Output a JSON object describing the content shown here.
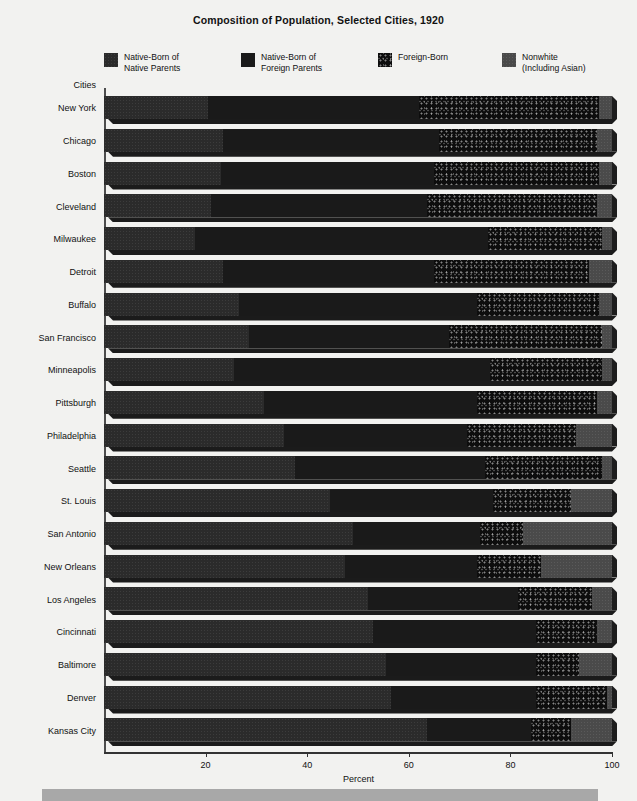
{
  "title": "Composition of Population, Selected Cities, 1920",
  "axis": {
    "y_title": "Cities",
    "x_title": "Percent",
    "x_ticks": [
      "20",
      "40",
      "60",
      "80",
      "100"
    ]
  },
  "legend": [
    {
      "key": "native_native",
      "label": "Native-Born of\nNative Parents",
      "color": "#2b2b2b"
    },
    {
      "key": "native_foreign",
      "label": "Native-Born of\nForeign Parents",
      "color": "#1a1a1a"
    },
    {
      "key": "foreign_born",
      "label": "Foreign-Born",
      "color": "#0d0d0d"
    },
    {
      "key": "nonwhite",
      "label": "Nonwhite\n(Including Asian)",
      "color": "#4a4a4a"
    }
  ],
  "chart_data": {
    "type": "bar",
    "orientation": "horizontal",
    "stacked": true,
    "title": "Composition of Population, Selected Cities, 1920",
    "xlabel": "Percent",
    "ylabel": "Cities",
    "xlim": [
      0,
      100
    ],
    "xticks": [
      20,
      40,
      60,
      80,
      100
    ],
    "grid": false,
    "legend_position": "top",
    "categories": [
      "New York",
      "Chicago",
      "Boston",
      "Cleveland",
      "Milwaukee",
      "Detroit",
      "Buffalo",
      "San Francisco",
      "Minneapolis",
      "Pittsburgh",
      "Philadelphia",
      "Seattle",
      "St. Louis",
      "San Antonio",
      "New Orleans",
      "Los Angeles",
      "Cincinnati",
      "Baltimore",
      "Denver",
      "Kansas City"
    ],
    "series": [
      {
        "name": "Native-Born of Native Parents",
        "values": [
          20.5,
          23.5,
          23.0,
          21.0,
          18.0,
          23.5,
          26.5,
          28.5,
          25.5,
          31.5,
          35.5,
          37.5,
          44.5,
          49.0,
          47.5,
          52.0,
          53.0,
          55.5,
          56.5,
          63.5
        ]
      },
      {
        "name": "Native-Born of Foreign Parents",
        "values": [
          41.5,
          42.5,
          42.0,
          42.5,
          57.5,
          41.5,
          47.0,
          39.5,
          50.5,
          42.0,
          36.0,
          37.5,
          32.0,
          25.0,
          26.0,
          29.5,
          32.0,
          29.5,
          28.5,
          20.5
        ]
      },
      {
        "name": "Foreign-Born",
        "values": [
          35.5,
          31.0,
          32.5,
          33.5,
          22.5,
          30.5,
          24.0,
          30.0,
          22.0,
          23.5,
          21.5,
          23.0,
          15.5,
          8.5,
          12.5,
          14.5,
          12.0,
          8.5,
          14.0,
          8.0
        ]
      },
      {
        "name": "Nonwhite (Including Asian)",
        "values": [
          2.5,
          3.0,
          2.5,
          3.0,
          2.0,
          4.5,
          2.5,
          2.0,
          2.0,
          3.0,
          7.0,
          2.0,
          8.0,
          17.5,
          14.0,
          4.0,
          3.0,
          6.5,
          1.0,
          8.0
        ]
      }
    ]
  }
}
